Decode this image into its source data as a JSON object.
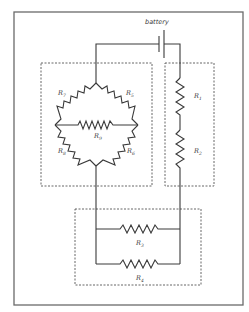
{
  "diagram": {
    "title": "",
    "battery": {
      "label": "battery"
    },
    "groups": [
      {
        "id": "bridge",
        "resistors": [
          "R7",
          "R8",
          "R9",
          "R6",
          "R5"
        ]
      },
      {
        "id": "series",
        "resistors": [
          "R1",
          "R2"
        ]
      },
      {
        "id": "parallel",
        "resistors": [
          "R3",
          "R4"
        ]
      }
    ],
    "resistors": {
      "r1": {
        "letter": "R",
        "sub": "1"
      },
      "r2": {
        "letter": "R",
        "sub": "2"
      },
      "r3": {
        "letter": "R",
        "sub": "3"
      },
      "r4": {
        "letter": "R",
        "sub": "4"
      },
      "r5": {
        "letter": "R",
        "sub": "5"
      },
      "r6": {
        "letter": "R",
        "sub": "6"
      },
      "r7": {
        "letter": "R",
        "sub": "7"
      },
      "r8": {
        "letter": "R",
        "sub": "8"
      },
      "r9": {
        "letter": "R",
        "sub": "9"
      }
    },
    "colors": {
      "line": "#3a3a3a",
      "frame": "#6a6a6a",
      "background": "#ffffff"
    }
  }
}
